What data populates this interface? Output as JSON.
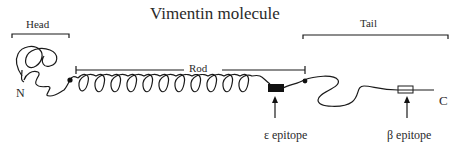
{
  "diagram": {
    "title": "Vimentin molecule",
    "regions": [
      {
        "name": "head",
        "label": "Head"
      },
      {
        "name": "rod",
        "label": "Rod"
      },
      {
        "name": "tail",
        "label": "Tail"
      }
    ],
    "termini": {
      "n": "N",
      "c": "C"
    },
    "epitopes": [
      {
        "name": "epsilon",
        "label": "ε epitope",
        "marker": "filled-box"
      },
      {
        "name": "beta",
        "label": "β epitope",
        "marker": "open-box"
      }
    ],
    "colors": {
      "stroke": "#1a1a1a",
      "background": "#ffffff"
    }
  }
}
